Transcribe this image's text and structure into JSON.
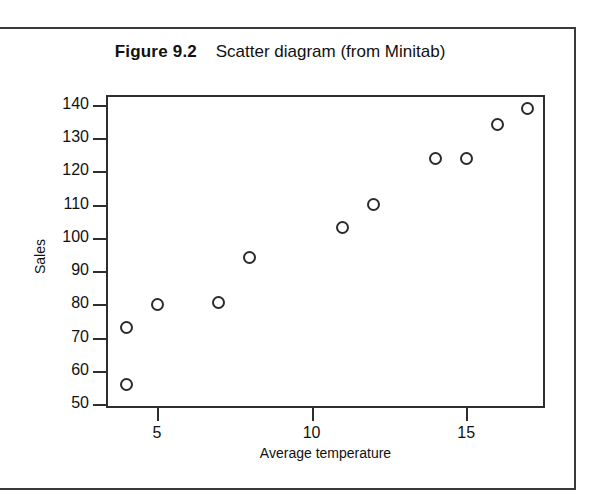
{
  "figure": {
    "number_label": "Figure 9.2",
    "caption": "Scatter diagram (from Minitab)"
  },
  "chart_data": {
    "type": "scatter",
    "title": "Figure 9.2  Scatter diagram (from Minitab)",
    "xlabel": "Average temperature",
    "ylabel": "Sales",
    "xlim": [
      3.35,
      17.55
    ],
    "ylim": [
      48.8,
      143.0
    ],
    "xticks": [
      5,
      10,
      15
    ],
    "yticks": [
      50,
      60,
      70,
      80,
      90,
      100,
      110,
      120,
      130,
      140
    ],
    "xtick_labels": [
      "5",
      "10",
      "15"
    ],
    "ytick_labels": [
      "50",
      "60",
      "70",
      "80",
      "90",
      "100",
      "110",
      "120",
      "130",
      "140"
    ],
    "grid": false,
    "legend": null,
    "marker": "open-circle",
    "marker_color": "#2b2b2b",
    "points": [
      {
        "x": 4,
        "y": 73
      },
      {
        "x": 4,
        "y": 56
      },
      {
        "x": 5,
        "y": 80
      },
      {
        "x": 7,
        "y": 80.5
      },
      {
        "x": 8,
        "y": 94
      },
      {
        "x": 11,
        "y": 103
      },
      {
        "x": 12,
        "y": 110
      },
      {
        "x": 14,
        "y": 124
      },
      {
        "x": 15,
        "y": 124
      },
      {
        "x": 16,
        "y": 134
      },
      {
        "x": 17,
        "y": 139
      }
    ]
  },
  "colors": {
    "axis": "#2e2e2e",
    "text": "#111111",
    "page_border": "#3a3a3a",
    "background": "#ffffff"
  }
}
